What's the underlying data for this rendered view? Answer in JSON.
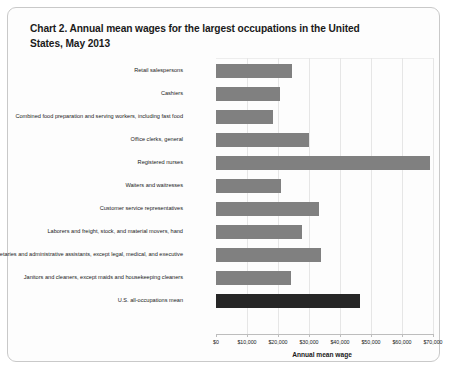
{
  "chart_data": {
    "type": "bar",
    "orientation": "horizontal",
    "title": "Chart 2. Annual mean wages for the largest occupations in the United States, May 2013",
    "xlabel": "Annual mean wage",
    "ylabel": "",
    "xlim": [
      0,
      70000
    ],
    "grid": true,
    "legend": "none",
    "tick_labels": [
      "$0",
      "$10,000",
      "$20,000",
      "$30,000",
      "$40,000",
      "$50,000",
      "$60,000",
      "$70,000"
    ],
    "tick_values": [
      0,
      10000,
      20000,
      30000,
      40000,
      50000,
      60000,
      70000
    ],
    "categories": [
      "Retail salespersons",
      "Cashiers",
      "Combined food preparation and serving workers, including fast food",
      "Office clerks, general",
      "Registered nurses",
      "Waiters and waitresses",
      "Customer service representatives",
      "Laborers and freight, stock, and material movers, hand",
      "Secretaries and administrative assistants, except legal, medical, and executive",
      "Janitors and cleaners, except maids and housekeeping cleaners",
      "U.S. all-occupations mean"
    ],
    "values": [
      24530,
      20670,
      18540,
      29990,
      68910,
      20880,
      33370,
      27670,
      34000,
      24190,
      46440
    ],
    "highlight_index": 10,
    "colors": {
      "bar": "#808080",
      "highlight_bar": "#262626",
      "gridline": "#e6e6e6",
      "axis": "#bdbdbd",
      "border": "#c9c9c9",
      "text": "#1a1a1a"
    }
  }
}
